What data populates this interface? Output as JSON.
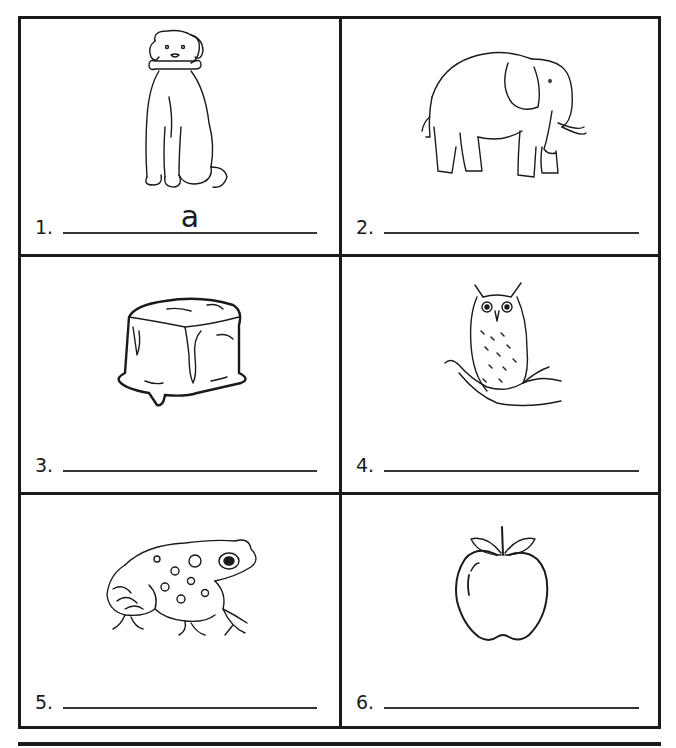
{
  "worksheet": {
    "items": [
      {
        "number": "1.",
        "picture": "dog-icon",
        "answer": "a"
      },
      {
        "number": "2.",
        "picture": "elephant-icon",
        "answer": ""
      },
      {
        "number": "3.",
        "picture": "ice-cube-icon",
        "answer": ""
      },
      {
        "number": "4.",
        "picture": "owl-icon",
        "answer": ""
      },
      {
        "number": "5.",
        "picture": "frog-icon",
        "answer": ""
      },
      {
        "number": "6.",
        "picture": "apple-icon",
        "answer": ""
      }
    ]
  }
}
